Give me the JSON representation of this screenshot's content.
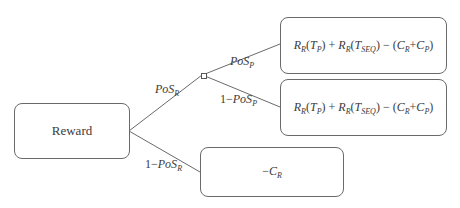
{
  "diagram": {
    "type": "decision-tree",
    "root": {
      "label": "Reward"
    },
    "branches": {
      "success_r": {
        "prob_label": {
          "base": "PoS",
          "sub": "R"
        },
        "children": {
          "success_p": {
            "prob_label": {
              "base": "PoS",
              "sub": "P"
            },
            "outcome": {
              "r1": "R",
              "r1_sub": "R",
              "r1_arg": "T",
              "r1_arg_sub": "P",
              "r2": "R",
              "r2_sub": "R",
              "r2_arg": "T",
              "r2_arg_sub": "SEQ",
              "c1": "C",
              "c1_sub": "R",
              "c2": "C",
              "c2_sub": "P"
            }
          },
          "fail_p": {
            "prob_label": {
              "prefix": "1−",
              "base": "PoS",
              "sub": "P"
            },
            "outcome": {
              "r1": "R",
              "r1_sub": "R",
              "r1_arg": "T",
              "r1_arg_sub": "P",
              "r2": "R",
              "r2_sub": "R",
              "r2_arg": "T",
              "r2_arg_sub": "SEQ",
              "c1": "C",
              "c1_sub": "R",
              "c2": "C",
              "c2_sub": "P"
            }
          }
        }
      },
      "fail_r": {
        "prob_label": {
          "prefix": "1−",
          "base": "PoS",
          "sub": "R"
        },
        "outcome": {
          "sign": "−",
          "c": "C",
          "c_sub": "R"
        }
      }
    },
    "colors": {
      "line": "#6a6a6a",
      "text": "#3a3a3a",
      "background": "#ffffff"
    }
  }
}
